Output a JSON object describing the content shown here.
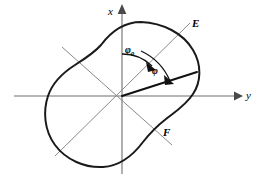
{
  "figure": {
    "kind": "polar-curve-diagram",
    "background_color": "#ffffff",
    "width": 263,
    "height": 181
  },
  "axes": {
    "origin": {
      "x": 122,
      "y": 96
    },
    "x_axis": {
      "label": "x",
      "label_x": 108,
      "label_y": 8,
      "direction": "up",
      "color": "#6e6e6e"
    },
    "y_axis": {
      "label": "y",
      "label_x": 246,
      "label_y": 92,
      "direction": "right",
      "color": "#6e6e6e"
    }
  },
  "rays": {
    "ef_line": {
      "start_label": "E",
      "end_label": "F",
      "color": "#8a8a8a"
    },
    "secondary_line": {
      "color": "#8a8a8a"
    }
  },
  "labels": {
    "E": {
      "text": "E",
      "x": 192,
      "y": 19
    },
    "F": {
      "text": "F",
      "x": 164,
      "y": 128
    },
    "phi_zero": {
      "text": "φ",
      "subscript": "0",
      "x": 126,
      "y": 45
    },
    "phi": {
      "text": "φ",
      "x": 152,
      "y": 66
    }
  },
  "radius_vector": {
    "from_x": 122,
    "from_y": 96,
    "to_x": 197,
    "to_y": 72,
    "color": "#111111",
    "description": "bold radius vector from origin to contour"
  },
  "angles": {
    "phi_zero_arc": {
      "label": "φ₀",
      "from_axis": "x",
      "to_ray": "E",
      "radius": 42
    },
    "phi_arc": {
      "label": "φ",
      "from_ray": "E",
      "to_ray": "radius-vector",
      "radius": 58
    }
  },
  "contour": {
    "color": "#1a1a1a",
    "stroke_width": 2.0,
    "shape": "peanut-shaped closed polar curve, rotated",
    "extent": {
      "left": 45,
      "right": 201,
      "top": 22,
      "bottom": 168
    }
  }
}
